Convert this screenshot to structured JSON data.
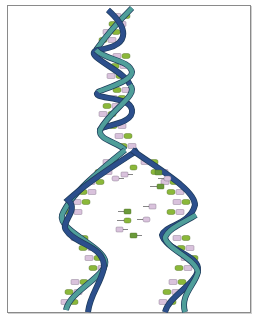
{
  "diagram": {
    "colors": {
      "strand_light": "#4f9e9a",
      "strand_dark": "#2c4f8c",
      "strand_outline": "#1f3d5c",
      "base_green": "#8bb83a",
      "base_olive": "#6a9a3a",
      "base_pink": "#d9c2dc",
      "border": "#8a8a8a"
    },
    "base_labels": [
      "A",
      "T",
      "G",
      "C"
    ],
    "free_nucleotides": [
      {
        "label": "T",
        "x": 125,
        "y": 174
      },
      {
        "label": "A",
        "x": 119,
        "y": 178
      },
      {
        "label": "C",
        "x": 128,
        "y": 167
      },
      {
        "label": "G",
        "x": 158,
        "y": 172
      },
      {
        "label": "A",
        "x": 166,
        "y": 178
      },
      {
        "label": "C",
        "x": 160,
        "y": 186
      },
      {
        "label": "T",
        "x": 152,
        "y": 206
      },
      {
        "label": "G",
        "x": 127,
        "y": 211
      },
      {
        "label": "C",
        "x": 127,
        "y": 220
      },
      {
        "label": "A",
        "x": 146,
        "y": 219
      },
      {
        "label": "T",
        "x": 120,
        "y": 229
      },
      {
        "label": "G",
        "x": 133,
        "y": 235
      }
    ]
  }
}
